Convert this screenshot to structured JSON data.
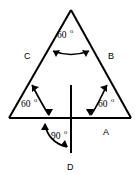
{
  "figure": {
    "type": "geometry-diagram",
    "shape": "equilateral-triangle-with-perpendicular",
    "background_color": "#ffffff",
    "stroke_color": "#000000"
  },
  "side_labels": {
    "left": "C",
    "right": "B",
    "bottom": "A",
    "vertical": "D"
  },
  "angles": [
    {
      "id": "apex",
      "value": "60",
      "degree_symbol": "o",
      "position": "top-vertex"
    },
    {
      "id": "bottom-left",
      "value": "60",
      "degree_symbol": "o",
      "position": "left-vertex"
    },
    {
      "id": "bottom-right",
      "value": "60",
      "degree_symbol": "o",
      "position": "right-vertex"
    },
    {
      "id": "perpendicular",
      "value": "90",
      "degree_symbol": "o",
      "position": "base-to-vertical-line"
    }
  ]
}
